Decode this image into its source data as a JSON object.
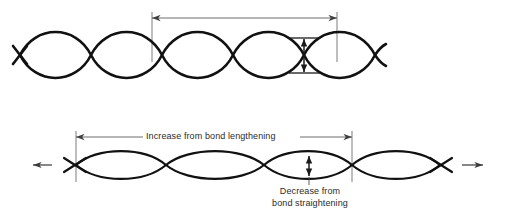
{
  "figure": {
    "title_text": "",
    "colors": {
      "wave": "#111111",
      "dimension_line": "#5b5b5b",
      "arrow": "#1a1a1a",
      "background": "#ffffff",
      "label_text": "#2b2b2b"
    },
    "labels": {
      "increase": "Increase from bond lengthening",
      "decrease_line1": "Decrease from",
      "decrease_line2": "bond straightening"
    },
    "panels": [
      {
        "name": "unstretched-crimped-fiber",
        "wave": {
          "amplitude_px": 18,
          "half_period_px": 61,
          "baseline_y_px": 55,
          "x_start_px": 20,
          "x_end_px": 386,
          "crossings_px": [
            20,
            30,
            91,
            152,
            213,
            275,
            337
          ],
          "crossing_count": 7
        },
        "dimensions": [
          {
            "name": "crimp-period-horizontal",
            "orientation": "horizontal",
            "from_x_px": 152,
            "to_x_px": 337,
            "y_px": 18,
            "length_px": 185,
            "label": "",
            "arrowheads": "both"
          },
          {
            "name": "crimp-amplitude-vertical",
            "orientation": "vertical",
            "x_px": 304,
            "from_y_px": 38,
            "to_y_px": 73,
            "length_px": 35,
            "label": "",
            "arrowheads": "both"
          }
        ]
      },
      {
        "name": "stretched-fiber",
        "wave": {
          "amplitude_px": 11,
          "half_period_px": 88,
          "baseline_y_px": 165,
          "x_start_px": 56,
          "x_end_px": 460,
          "crossings_px": [
            76,
            166,
            264,
            352,
            440
          ],
          "crossing_count": 5
        },
        "load_arrows": [
          {
            "name": "tension-arrow-left",
            "direction": "left",
            "x_tip_px": 33,
            "x_tail_px": 52,
            "y_px": 165
          },
          {
            "name": "tension-arrow-right",
            "direction": "right",
            "x_tip_px": 483,
            "x_tail_px": 462,
            "y_px": 165
          }
        ],
        "dimensions": [
          {
            "name": "increase-from-bond-lengthening",
            "orientation": "horizontal",
            "from_x_px": 76,
            "to_x_px": 352,
            "y_px": 137,
            "length_px": 276,
            "label": "Increase from bond lengthening",
            "arrowheads": "both"
          },
          {
            "name": "decrease-from-bond-straightening",
            "orientation": "vertical",
            "x_px": 309,
            "from_y_px": 155,
            "to_y_px": 177,
            "length_px": 22,
            "label": "Decrease from bond straightening",
            "arrowheads": "both"
          }
        ]
      }
    ]
  }
}
